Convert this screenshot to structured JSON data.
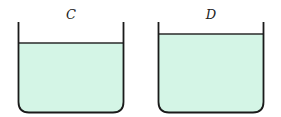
{
  "containers": [
    {
      "label": "C",
      "water_fill": "#d4f5e6"
    },
    {
      "label": "D",
      "water_fill": "#d4f5e6"
    }
  ],
  "colors": {
    "outline": "#1a1a1a",
    "water": "#d4f5e6",
    "water_line": "#2a2a2a"
  }
}
